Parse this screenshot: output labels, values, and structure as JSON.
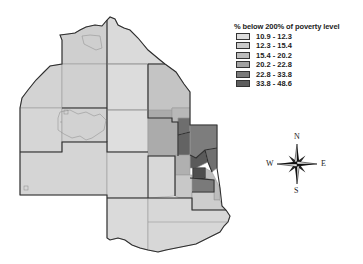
{
  "legend": {
    "title": "% below 200% of poverty level",
    "classes": [
      {
        "label": "10.9 - 12.3",
        "color": "#dcdcdc"
      },
      {
        "label": "12.3 - 15.4",
        "color": "#cbcbcb"
      },
      {
        "label": "15.4 - 20.2",
        "color": "#bcbcbc"
      },
      {
        "label": "20.2 - 22.8",
        "color": "#a2a2a2"
      },
      {
        "label": "22.8 - 33.8",
        "color": "#7a7a7a"
      },
      {
        "label": "33.8 - 48.6",
        "color": "#5e5e5e"
      }
    ]
  },
  "compass": {
    "north": "N",
    "south": "S",
    "east": "E",
    "west": "W"
  },
  "map": {
    "border_color": "#333333",
    "inner_line_color": "#8a8a8a"
  }
}
